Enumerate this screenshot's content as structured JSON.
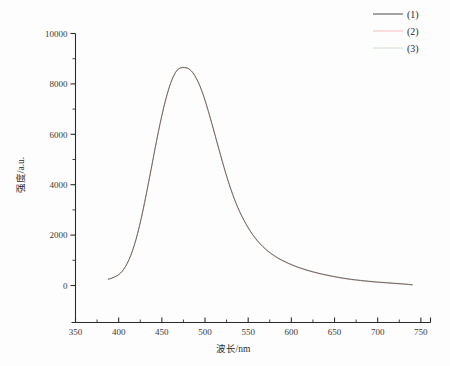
{
  "chart_data": {
    "type": "line",
    "title": "",
    "xlabel": "波长/nm",
    "ylabel": "强度/a.u.",
    "xlim": [
      350,
      760
    ],
    "ylim": [
      0,
      10000
    ],
    "xticks": [
      350,
      400,
      450,
      500,
      550,
      600,
      650,
      700,
      750
    ],
    "yticks": [
      0,
      2000,
      4000,
      6000,
      8000,
      10000
    ],
    "xtick_labels": [
      "350",
      "400",
      "450",
      "500",
      "550",
      "600",
      "650",
      "700",
      "750"
    ],
    "ytick_labels": [
      "0",
      "2000",
      "4000",
      "6000",
      "8000",
      "10000"
    ],
    "x_minor_step": 25,
    "y_minor_step": 1000,
    "grid": false,
    "legend_position": "top-right",
    "peak_x": 478,
    "peak_y": 8650,
    "x": [
      388,
      392,
      396,
      400,
      404,
      408,
      412,
      416,
      420,
      424,
      428,
      432,
      436,
      440,
      444,
      448,
      452,
      456,
      460,
      464,
      468,
      472,
      476,
      480,
      484,
      488,
      492,
      496,
      500,
      504,
      508,
      512,
      516,
      520,
      524,
      528,
      532,
      536,
      540,
      546,
      552,
      558,
      564,
      570,
      576,
      582,
      588,
      594,
      600,
      608,
      616,
      624,
      632,
      640,
      650,
      660,
      670,
      680,
      690,
      700,
      710,
      720,
      730,
      740
    ],
    "series": [
      {
        "name": "(1)",
        "color": "#4a4a4a",
        "values": [
          250,
          290,
          350,
          430,
          560,
          760,
          1030,
          1380,
          1820,
          2350,
          2960,
          3630,
          4330,
          5050,
          5760,
          6430,
          7040,
          7570,
          8010,
          8340,
          8550,
          8640,
          8650,
          8620,
          8520,
          8340,
          8080,
          7750,
          7350,
          6900,
          6420,
          5920,
          5420,
          4930,
          4460,
          4020,
          3620,
          3260,
          2940,
          2530,
          2180,
          1890,
          1650,
          1450,
          1280,
          1140,
          1020,
          920,
          830,
          720,
          630,
          550,
          480,
          420,
          350,
          290,
          240,
          200,
          165,
          135,
          110,
          85,
          60,
          30
        ]
      },
      {
        "name": "(2)",
        "color": "#f5b7b7",
        "values": [
          248,
          288,
          347,
          427,
          556,
          755,
          1024,
          1374,
          1812,
          2342,
          2950,
          3620,
          4320,
          5040,
          5748,
          6418,
          7028,
          7558,
          7998,
          8328,
          8538,
          8628,
          8638,
          8608,
          8508,
          8328,
          8068,
          7738,
          7338,
          6888,
          6408,
          5908,
          5408,
          4918,
          4448,
          4008,
          3608,
          3248,
          2928,
          2518,
          2168,
          1878,
          1638,
          1438,
          1268,
          1128,
          1008,
          908,
          818,
          708,
          618,
          538,
          468,
          408,
          338,
          278,
          228,
          188,
          153,
          123,
          98,
          73,
          48,
          18
        ]
      },
      {
        "name": "(3)",
        "color": "#c4e0c4",
        "values": [
          252,
          292,
          353,
          433,
          564,
          765,
          1036,
          1386,
          1828,
          2358,
          2970,
          3640,
          4340,
          5060,
          5772,
          6442,
          7052,
          7582,
          8022,
          8352,
          8562,
          8652,
          8662,
          8632,
          8532,
          8352,
          8092,
          7762,
          7362,
          6912,
          6432,
          5932,
          5432,
          4942,
          4472,
          4032,
          3632,
          3272,
          2952,
          2542,
          2192,
          1902,
          1662,
          1462,
          1292,
          1152,
          1032,
          932,
          842,
          732,
          642,
          562,
          492,
          432,
          362,
          302,
          252,
          212,
          177,
          147,
          122,
          97,
          72,
          42
        ]
      }
    ]
  },
  "legend": {
    "entries": [
      {
        "label": "(1)",
        "color": "#4a4a4a"
      },
      {
        "label": "(2)",
        "color": "#f5b7b7"
      },
      {
        "label": "(3)",
        "color": "#c4e0c4"
      }
    ]
  },
  "axes": {
    "x_title": "波长/nm",
    "y_title": "强度/a.u."
  }
}
